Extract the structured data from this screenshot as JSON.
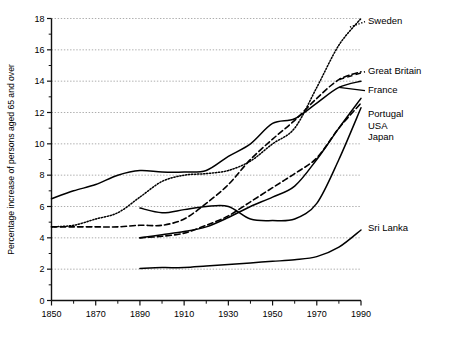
{
  "chart_data": {
    "type": "line",
    "title": "",
    "xlabel": "",
    "ylabel": "Percentage increase of persons aged 65 and over",
    "xlim": [
      1850,
      1990
    ],
    "ylim": [
      0,
      18
    ],
    "xticks": [
      1850,
      1870,
      1890,
      1910,
      1930,
      1950,
      1970,
      1990
    ],
    "xticks_minor": [
      1860,
      1880,
      1900,
      1920,
      1940,
      1960,
      1980
    ],
    "yticks": [
      0,
      2,
      4,
      6,
      8,
      10,
      12,
      14,
      16,
      18
    ],
    "yticks_minor": [
      1,
      3,
      5,
      7,
      9,
      11,
      13,
      15,
      17
    ],
    "grid": "horizontal-dotted",
    "legend_position": "right-inline-labels",
    "series": [
      {
        "name": "Sweden",
        "style": "dotted",
        "label": "Sweden",
        "x": [
          1850,
          1860,
          1870,
          1880,
          1890,
          1900,
          1910,
          1920,
          1930,
          1940,
          1950,
          1960,
          1970,
          1980,
          1990
        ],
        "y": [
          4.7,
          4.8,
          5.2,
          5.6,
          6.6,
          7.6,
          8.0,
          8.1,
          8.3,
          8.9,
          10.0,
          11.0,
          13.6,
          16.3,
          18.0
        ]
      },
      {
        "name": "Great Britain",
        "style": "dashed",
        "label": "Great Britain",
        "x": [
          1850,
          1860,
          1870,
          1880,
          1890,
          1900,
          1910,
          1920,
          1930,
          1940,
          1950,
          1960,
          1970,
          1980,
          1990
        ],
        "y": [
          4.7,
          4.7,
          4.7,
          4.7,
          4.8,
          4.8,
          5.2,
          6.2,
          7.4,
          9.0,
          10.3,
          11.5,
          12.9,
          14.1,
          14.6
        ]
      },
      {
        "name": "France",
        "style": "solid",
        "label": "France",
        "x": [
          1850,
          1860,
          1870,
          1880,
          1890,
          1900,
          1910,
          1920,
          1930,
          1940,
          1950,
          1960,
          1970,
          1980,
          1990
        ],
        "y": [
          6.5,
          7.0,
          7.4,
          8.0,
          8.3,
          8.2,
          8.2,
          8.3,
          9.2,
          10.0,
          11.3,
          11.6,
          12.6,
          13.6,
          14.0
        ]
      },
      {
        "name": "Portugal",
        "style": "solid",
        "label": "Portugal",
        "x": [
          1890,
          1900,
          1910,
          1920,
          1930,
          1940,
          1950,
          1960,
          1970,
          1980,
          1990
        ],
        "y": [
          4.0,
          4.2,
          4.4,
          4.7,
          5.3,
          6.0,
          6.6,
          7.3,
          9.0,
          11.0,
          12.9
        ]
      },
      {
        "name": "USA",
        "style": "dashed",
        "label": "USA",
        "x": [
          1890,
          1900,
          1910,
          1920,
          1930,
          1940,
          1950,
          1960,
          1970,
          1980,
          1990
        ],
        "y": [
          4.0,
          4.1,
          4.3,
          4.8,
          5.4,
          6.3,
          7.2,
          8.1,
          9.1,
          11.0,
          12.6
        ]
      },
      {
        "name": "Japan",
        "style": "solid",
        "label": "Japan",
        "x": [
          1890,
          1900,
          1910,
          1920,
          1930,
          1940,
          1950,
          1960,
          1970,
          1980,
          1990
        ],
        "y": [
          5.9,
          5.6,
          5.8,
          6.0,
          6.0,
          5.2,
          5.1,
          5.2,
          6.2,
          9.0,
          12.3
        ]
      },
      {
        "name": "Sri Lanka",
        "style": "solid",
        "label": "Sri Lanka",
        "x": [
          1890,
          1900,
          1910,
          1920,
          1930,
          1940,
          1950,
          1960,
          1970,
          1980,
          1990
        ],
        "y": [
          2.05,
          2.1,
          2.1,
          2.2,
          2.3,
          2.4,
          2.5,
          2.6,
          2.8,
          3.4,
          4.5
        ]
      }
    ],
    "annotations": [
      {
        "text": "Sweden",
        "x": 1990,
        "y": 17.8
      },
      {
        "text": "Great Britain",
        "x": 1990,
        "y": 14.6
      },
      {
        "text": "France",
        "x": 1990,
        "y": 13.4
      },
      {
        "text": "Portugal",
        "x": 1990,
        "y": 11.9
      },
      {
        "text": "USA",
        "x": 1990,
        "y": 11.1
      },
      {
        "text": "Japan",
        "x": 1990,
        "y": 10.4
      },
      {
        "text": "Sri Lanka",
        "x": 1990,
        "y": 4.6
      }
    ]
  }
}
